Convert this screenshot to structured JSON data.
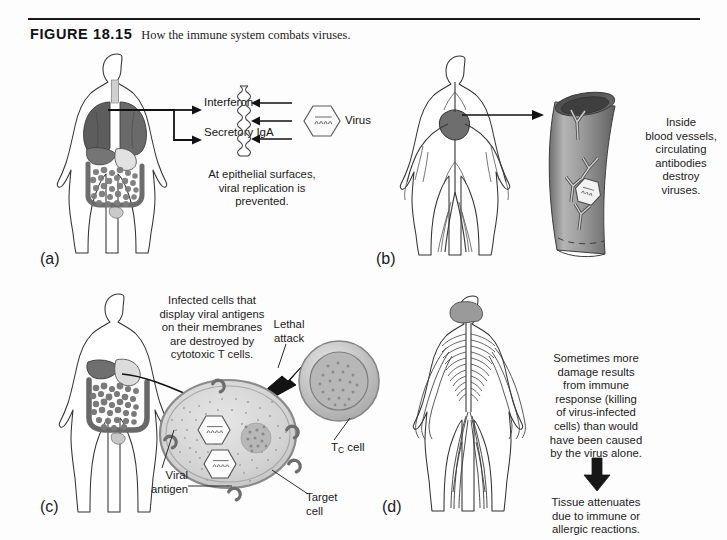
{
  "figure": {
    "label": "FIGURE 18.15",
    "caption": "How the immune system combats viruses."
  },
  "panels": {
    "a": {
      "letter": "(a)",
      "body_diagram": "respiratory-digestive-system-body",
      "arrow_labels": [
        "Interferon",
        "Secretory IgA"
      ],
      "virus_label": "Virus",
      "caption_lines": [
        "At epithelial surfaces,",
        "viral replication is",
        "prevented."
      ],
      "caption": "At epithelial surfaces, viral replication is prevented."
    },
    "b": {
      "letter": "(b)",
      "body_diagram": "circulatory-system-body",
      "caption_lines": [
        "Inside",
        "blood vessels,",
        "circulating",
        "antibodies",
        "destroy",
        "viruses."
      ],
      "caption": "Inside blood vessels, circulating antibodies destroy viruses."
    },
    "c": {
      "letter": "(c)",
      "body_diagram": "digestive-system-body",
      "caption_lines": [
        "Infected cells that",
        "display viral antigens",
        "on their membranes",
        "are destroyed by",
        "cytotoxic T cells."
      ],
      "caption": "Infected cells that display viral antigens on their membranes are destroyed by cytotoxic T cells.",
      "lethal_attack_lines": [
        "Lethal",
        "attack"
      ],
      "tc_cell_label_main": "T",
      "tc_cell_label_sub": "C",
      "tc_cell_label_tail": " cell",
      "viral_antigen_lines": [
        "Viral",
        "antigen"
      ],
      "target_cell_lines": [
        "Target",
        "cell"
      ]
    },
    "d": {
      "letter": "(d)",
      "body_diagram": "nervous-system-body",
      "caption_lines": [
        "Sometimes more",
        "damage results",
        "from immune",
        "response (killing",
        "of virus-infected",
        "cells) than would",
        "have been caused",
        "by the virus alone."
      ],
      "caption": "Sometimes more damage results from immune response (killing of virus-infected cells) than would have been caused by the virus alone.",
      "outcome_lines": [
        "Tissue attenuates",
        "due to immune or",
        "allergic reactions."
      ],
      "outcome": "Tissue attenuates due to immune or allergic reactions."
    }
  },
  "colors": {
    "page_background": "#fdfdfd",
    "ink": "#1a1a1a",
    "organ_dark": "#5d5d5d",
    "organ_mid": "#8e8e8e",
    "organ_light": "#b9b9b9",
    "cell_fill": "#d5d5d5",
    "vessel_gray": "#8f8f8f",
    "outline": "#3a3a3a"
  }
}
